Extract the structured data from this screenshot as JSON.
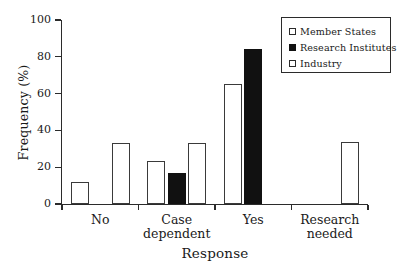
{
  "chart_data": {
    "type": "bar",
    "title": "",
    "xlabel": "Response",
    "ylabel": "Frequency (%)",
    "categories": [
      "No",
      "Case dependent",
      "Yes",
      "Research needed"
    ],
    "category_lines": [
      [
        "No"
      ],
      [
        "Case",
        "dependent"
      ],
      [
        "Yes"
      ],
      [
        "Research",
        "needed"
      ]
    ],
    "series": [
      {
        "name": "Member States",
        "style": "open",
        "values": [
          12,
          23.5,
          65,
          0
        ]
      },
      {
        "name": "Research Institutes",
        "style": "filled",
        "values": [
          0,
          17,
          84,
          0
        ]
      },
      {
        "name": "Industry",
        "style": "open",
        "values": [
          33.3,
          33.3,
          0,
          33.5
        ]
      }
    ],
    "ylim": [
      0,
      100
    ],
    "yticks": [
      0,
      20,
      40,
      60,
      80,
      100
    ],
    "ytick_labels": [
      "0",
      "20",
      "40",
      "60",
      "80",
      "100"
    ],
    "grid": false,
    "legend_position": "top-right",
    "colors": {
      "open_fill": "#ffffff",
      "open_edge": "#3a3a3a",
      "filled": "#111111",
      "axis": "#2b2b2b",
      "text": "#1a1a1a"
    }
  },
  "legend": {
    "entries": [
      {
        "label": "Member States",
        "style": "open"
      },
      {
        "label": "Research Institutes",
        "style": "filled"
      },
      {
        "label": "Industry",
        "style": "open"
      }
    ]
  }
}
